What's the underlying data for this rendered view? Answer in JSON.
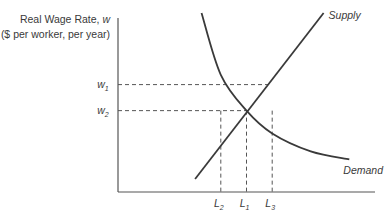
{
  "chart_data": {
    "type": "line",
    "title": "",
    "ylabel_line1": "Real Wage Rate,",
    "ylabel_var": "w",
    "ylabel_line2": "($ per worker, per year)",
    "xlabel": "",
    "series": [
      {
        "name": "Supply",
        "label": "Supply",
        "kind": "linear",
        "points": [
          [
            0.6,
            0.08
          ],
          [
            1.6,
            1.1
          ]
        ]
      },
      {
        "name": "Demand",
        "label": "Demand",
        "kind": "curve",
        "points": [
          [
            0.65,
            1.1
          ],
          [
            0.8,
            0.72
          ],
          [
            1.0,
            0.5
          ],
          [
            1.2,
            0.36
          ],
          [
            1.5,
            0.25
          ],
          [
            1.8,
            0.2
          ]
        ]
      }
    ],
    "equilibrium": {
      "x_label": "L1",
      "y_label": "w2",
      "x": 1.0,
      "y": 0.5
    },
    "reference_lines": {
      "horizontal": [
        {
          "label_main": "w",
          "label_sub": "1",
          "y": 0.66
        },
        {
          "label_main": "w",
          "label_sub": "2",
          "y": 0.5
        }
      ],
      "vertical": [
        {
          "label_main": "L",
          "label_sub": "2",
          "x": 0.8
        },
        {
          "label_main": "L",
          "label_sub": "1",
          "x": 1.0
        },
        {
          "label_main": "L",
          "label_sub": "3",
          "x": 1.2
        }
      ]
    },
    "xlim": [
      0,
      2.0
    ],
    "ylim": [
      0,
      1.1
    ],
    "grid": false,
    "legend": "none"
  }
}
